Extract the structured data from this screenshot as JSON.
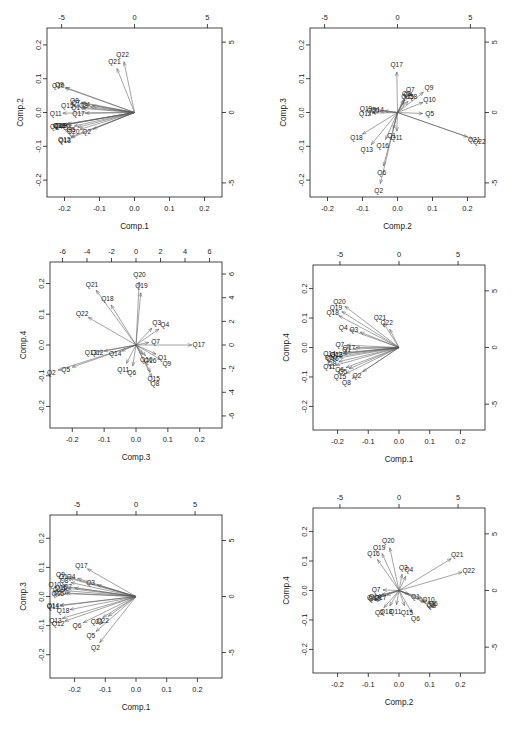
{
  "figure": {
    "type": "pca-biplot-matrix",
    "rows": 3,
    "cols": 2,
    "variables": [
      "Q1",
      "Q2",
      "Q3",
      "Q4",
      "Q5",
      "Q6",
      "Q7",
      "Q8",
      "Q9",
      "Q10",
      "Q11",
      "Q12",
      "Q13",
      "Q14",
      "Q15",
      "Q16",
      "Q17",
      "Q18",
      "Q19",
      "Q20",
      "Q21",
      "Q22"
    ]
  },
  "chart_data": [
    {
      "id": "panel-comp1-comp2",
      "type": "scatter",
      "title": "",
      "xlabel": "Comp.1",
      "ylabel": "Comp.2",
      "xlim": [
        -0.25,
        0.25
      ],
      "ylim": [
        -0.25,
        0.25
      ],
      "xticks": [
        "-0.2",
        "-0.1",
        "0.0",
        "0.1",
        "0.2"
      ],
      "xtickvals": [
        -0.2,
        -0.1,
        0.0,
        0.1,
        0.2
      ],
      "yticks": [
        "-0.2",
        "-0.1",
        "0.0",
        "0.1",
        "0.2"
      ],
      "ytickvals": [
        -0.2,
        -0.1,
        0.0,
        0.1,
        0.2
      ],
      "top_axis_ticks": [
        "-5",
        "0",
        "5"
      ],
      "top_axis_vals": [
        -5,
        0,
        5
      ],
      "right_axis_ticks": [
        "5",
        "0",
        "-5"
      ],
      "right_axis_vals": [
        5,
        0,
        -5
      ],
      "secondary_scale": 24.0,
      "grid": false,
      "legend": "none",
      "vectors": [
        {
          "label": "Q1",
          "x": -0.148,
          "y": 0.012
        },
        {
          "label": "Q2",
          "x": -0.118,
          "y": -0.049
        },
        {
          "label": "Q3",
          "x": -0.126,
          "y": 0.017
        },
        {
          "label": "Q4",
          "x": -0.12,
          "y": 0.02
        },
        {
          "label": "Q5",
          "x": -0.162,
          "y": -0.044
        },
        {
          "label": "Q6",
          "x": -0.172,
          "y": -0.04
        },
        {
          "label": "Q7",
          "x": -0.148,
          "y": 0.027
        },
        {
          "label": "Q8",
          "x": -0.152,
          "y": 0.03
        },
        {
          "label": "Q9",
          "x": -0.196,
          "y": 0.074
        },
        {
          "label": "Q10",
          "x": -0.199,
          "y": 0.073
        },
        {
          "label": "Q11",
          "x": -0.205,
          "y": -0.002
        },
        {
          "label": "Q12",
          "x": -0.182,
          "y": -0.072
        },
        {
          "label": "Q13",
          "x": -0.181,
          "y": -0.075
        },
        {
          "label": "Q14",
          "x": -0.204,
          "y": -0.037
        },
        {
          "label": "Q15",
          "x": -0.172,
          "y": 0.018
        },
        {
          "label": "Q16",
          "x": -0.194,
          "y": -0.034
        },
        {
          "label": "Q17",
          "x": -0.14,
          "y": -0.002
        },
        {
          "label": "Q18",
          "x": -0.196,
          "y": -0.036
        },
        {
          "label": "Q19",
          "x": -0.19,
          "y": -0.035
        },
        {
          "label": "Q20",
          "x": -0.156,
          "y": -0.05
        },
        {
          "label": "Q21",
          "x": -0.05,
          "y": 0.13
        },
        {
          "label": "Q22",
          "x": -0.03,
          "y": 0.15
        }
      ]
    },
    {
      "id": "panel-comp2-comp3",
      "type": "scatter",
      "title": "",
      "xlabel": "Comp.2",
      "ylabel": "Comp.3",
      "xlim": [
        -0.25,
        0.25
      ],
      "ylim": [
        -0.25,
        0.25
      ],
      "xticks": [
        "-0.2",
        "-0.1",
        "0.0",
        "0.1",
        "0.2"
      ],
      "xtickvals": [
        -0.2,
        -0.1,
        0.0,
        0.1,
        0.2
      ],
      "yticks": [
        "-0.2",
        "-0.1",
        "0.0",
        "0.1",
        "0.2"
      ],
      "ytickvals": [
        -0.2,
        -0.1,
        0.0,
        0.1,
        0.2
      ],
      "top_axis_ticks": [
        "-5",
        "0",
        "5"
      ],
      "top_axis_vals": [
        -5,
        0,
        5
      ],
      "right_axis_ticks": [
        "5",
        "0",
        "-5"
      ],
      "right_axis_vals": [
        5,
        0,
        -5
      ],
      "secondary_scale": 24.0,
      "grid": false,
      "legend": "none",
      "vectors": [
        {
          "label": "Q1",
          "x": -0.012,
          "y": -0.048
        },
        {
          "label": "Q2",
          "x": -0.049,
          "y": -0.21
        },
        {
          "label": "Q3",
          "x": 0.017,
          "y": 0.038
        },
        {
          "label": "Q4",
          "x": 0.02,
          "y": 0.036
        },
        {
          "label": "Q5",
          "x": 0.072,
          "y": -0.003
        },
        {
          "label": "Q6",
          "x": -0.04,
          "y": -0.158
        },
        {
          "label": "Q7",
          "x": 0.027,
          "y": 0.05
        },
        {
          "label": "Q8",
          "x": 0.03,
          "y": 0.033
        },
        {
          "label": "Q9",
          "x": 0.074,
          "y": 0.06
        },
        {
          "label": "Q10",
          "x": 0.073,
          "y": 0.03
        },
        {
          "label": "Q11",
          "x": -0.002,
          "y": -0.055
        },
        {
          "label": "Q12",
          "x": -0.072,
          "y": -0.002
        },
        {
          "label": "Q13",
          "x": -0.075,
          "y": -0.095
        },
        {
          "label": "Q14",
          "x": -0.037,
          "y": 0.005
        },
        {
          "label": "Q15",
          "x": 0.018,
          "y": 0.03
        },
        {
          "label": "Q16",
          "x": -0.034,
          "y": -0.08
        },
        {
          "label": "Q17",
          "x": -0.002,
          "y": 0.12
        },
        {
          "label": "Q18",
          "x": -0.1,
          "y": -0.064
        },
        {
          "label": "Q19",
          "x": -0.07,
          "y": 0.01
        },
        {
          "label": "Q20",
          "x": -0.05,
          "y": 0.003
        },
        {
          "label": "Q21",
          "x": 0.2,
          "y": -0.072
        },
        {
          "label": "Q22",
          "x": 0.215,
          "y": -0.078
        }
      ]
    },
    {
      "id": "panel-comp3-comp4",
      "type": "scatter",
      "title": "",
      "xlabel": "Comp.3",
      "ylabel": "Comp.4",
      "xlim": [
        -0.27,
        0.27
      ],
      "ylim": [
        -0.27,
        0.27
      ],
      "xticks": [
        "-0.2",
        "-0.1",
        "0.0",
        "0.1",
        "0.2"
      ],
      "xtickvals": [
        -0.2,
        -0.1,
        0.0,
        0.1,
        0.2
      ],
      "yticks": [
        "-0.2",
        "-0.1",
        "0.0",
        "0.1",
        "0.2"
      ],
      "ytickvals": [
        -0.2,
        -0.1,
        0.0,
        0.1,
        0.2
      ],
      "top_axis_ticks": [
        "-6",
        "-4",
        "-2",
        "0",
        "2",
        "4",
        "6"
      ],
      "top_axis_vals": [
        -6,
        -4,
        -2,
        0,
        2,
        4,
        6
      ],
      "right_axis_ticks": [
        "6",
        "4",
        "2",
        "0",
        "-2",
        "-4",
        "-6"
      ],
      "right_axis_vals": [
        6,
        4,
        2,
        0,
        -2,
        -4,
        -6
      ],
      "secondary_scale": 26.0,
      "grid": false,
      "legend": "none",
      "vectors": [
        {
          "label": "Q1",
          "x": 0.063,
          "y": -0.03
        },
        {
          "label": "Q2",
          "x": -0.245,
          "y": -0.082
        },
        {
          "label": "Q3",
          "x": 0.05,
          "y": 0.055
        },
        {
          "label": "Q4",
          "x": 0.072,
          "y": 0.052
        },
        {
          "label": "Q5",
          "x": -0.2,
          "y": -0.072
        },
        {
          "label": "Q6",
          "x": -0.01,
          "y": -0.068
        },
        {
          "label": "Q7",
          "x": 0.04,
          "y": 0.008
        },
        {
          "label": "Q8",
          "x": 0.05,
          "y": -0.105
        },
        {
          "label": "Q9",
          "x": 0.078,
          "y": -0.048
        },
        {
          "label": "Q10",
          "x": 0.02,
          "y": -0.03
        },
        {
          "label": "Q11",
          "x": -0.03,
          "y": -0.06
        },
        {
          "label": "Q12",
          "x": -0.1,
          "y": -0.02
        },
        {
          "label": "Q13",
          "x": -0.12,
          "y": -0.022
        },
        {
          "label": "Q14",
          "x": -0.045,
          "y": -0.02
        },
        {
          "label": "Q15",
          "x": 0.045,
          "y": -0.088
        },
        {
          "label": "Q16",
          "x": 0.03,
          "y": -0.035
        },
        {
          "label": "Q17",
          "x": 0.175,
          "y": 0.0
        },
        {
          "label": "Q18",
          "x": -0.078,
          "y": 0.13
        },
        {
          "label": "Q19",
          "x": 0.015,
          "y": 0.17
        },
        {
          "label": "Q20",
          "x": 0.01,
          "y": 0.205
        },
        {
          "label": "Q21",
          "x": -0.125,
          "y": 0.178
        },
        {
          "label": "Q22",
          "x": -0.15,
          "y": 0.09
        }
      ]
    },
    {
      "id": "panel-comp1-comp4",
      "type": "scatter",
      "title": "",
      "xlabel": "Comp.1",
      "ylabel": "Comp.4",
      "xlim": [
        -0.28,
        0.28
      ],
      "ylim": [
        -0.28,
        0.28
      ],
      "xticks": [
        "-0.2",
        "-0.1",
        "0.0",
        "0.1",
        "0.2"
      ],
      "xtickvals": [
        -0.2,
        -0.1,
        0.0,
        0.1,
        0.2
      ],
      "yticks": [
        "-0.2",
        "-0.1",
        "0.0",
        "0.1",
        "0.2"
      ],
      "ytickvals": [
        -0.2,
        -0.1,
        0.0,
        0.1,
        0.2
      ],
      "top_axis_ticks": [
        "-5",
        "0",
        "5"
      ],
      "top_axis_vals": [
        -5,
        0,
        5
      ],
      "right_axis_ticks": [
        "5",
        "0",
        "-5"
      ],
      "right_axis_vals": [
        5,
        0,
        -5
      ],
      "secondary_scale": 26.0,
      "grid": false,
      "legend": "none",
      "vectors": [
        {
          "label": "Q1",
          "x": -0.148,
          "y": -0.005
        },
        {
          "label": "Q2",
          "x": -0.118,
          "y": -0.082
        },
        {
          "label": "Q3",
          "x": -0.126,
          "y": 0.052
        },
        {
          "label": "Q4",
          "x": -0.16,
          "y": 0.06
        },
        {
          "label": "Q5",
          "x": -0.162,
          "y": -0.072
        },
        {
          "label": "Q6",
          "x": -0.172,
          "y": -0.068
        },
        {
          "label": "Q7",
          "x": -0.17,
          "y": 0.008
        },
        {
          "label": "Q8",
          "x": -0.152,
          "y": -0.105
        },
        {
          "label": "Q9",
          "x": -0.196,
          "y": -0.048
        },
        {
          "label": "Q10",
          "x": -0.199,
          "y": -0.03
        },
        {
          "label": "Q11",
          "x": -0.205,
          "y": -0.06
        },
        {
          "label": "Q12",
          "x": -0.182,
          "y": -0.02
        },
        {
          "label": "Q13",
          "x": -0.181,
          "y": -0.022
        },
        {
          "label": "Q14",
          "x": -0.204,
          "y": -0.02
        },
        {
          "label": "Q15",
          "x": -0.172,
          "y": -0.088
        },
        {
          "label": "Q16",
          "x": -0.194,
          "y": -0.035
        },
        {
          "label": "Q17",
          "x": -0.14,
          "y": 0.0
        },
        {
          "label": "Q18",
          "x": -0.196,
          "y": 0.108
        },
        {
          "label": "Q19",
          "x": -0.186,
          "y": 0.122
        },
        {
          "label": "Q20",
          "x": -0.176,
          "y": 0.14
        },
        {
          "label": "Q21",
          "x": -0.05,
          "y": 0.082
        },
        {
          "label": "Q22",
          "x": -0.03,
          "y": 0.062
        }
      ]
    },
    {
      "id": "panel-comp1-comp3",
      "type": "scatter",
      "title": "",
      "xlabel": "Comp.1",
      "ylabel": "Comp.3",
      "xlim": [
        -0.28,
        0.28
      ],
      "ylim": [
        -0.28,
        0.28
      ],
      "xticks": [
        "-0.2",
        "-0.1",
        "0.0",
        "0.1",
        "0.2"
      ],
      "xtickvals": [
        -0.2,
        -0.1,
        0.0,
        0.1,
        0.2
      ],
      "yticks": [
        "-0.2",
        "-0.1",
        "0.0",
        "0.1",
        "0.2"
      ],
      "ytickvals": [
        -0.2,
        -0.1,
        0.0,
        0.1,
        0.2
      ],
      "top_axis_ticks": [
        "-5",
        "0",
        "5"
      ],
      "top_axis_vals": [
        -5,
        0,
        5
      ],
      "right_axis_ticks": [
        "5",
        "0",
        "-5"
      ],
      "right_axis_vals": [
        5,
        0,
        -5
      ],
      "secondary_scale": 26.0,
      "grid": false,
      "legend": "none",
      "vectors": [
        {
          "label": "Q1",
          "x": -0.215,
          "y": 0.062
        },
        {
          "label": "Q2",
          "x": -0.118,
          "y": -0.158
        },
        {
          "label": "Q3",
          "x": -0.126,
          "y": 0.04
        },
        {
          "label": "Q4",
          "x": -0.19,
          "y": 0.062
        },
        {
          "label": "Q5",
          "x": -0.13,
          "y": -0.12
        },
        {
          "label": "Q6",
          "x": -0.172,
          "y": -0.09
        },
        {
          "label": "Q7",
          "x": -0.2,
          "y": 0.03
        },
        {
          "label": "Q8",
          "x": -0.212,
          "y": 0.048
        },
        {
          "label": "Q9",
          "x": -0.224,
          "y": 0.068
        },
        {
          "label": "Q10",
          "x": -0.242,
          "y": 0.036
        },
        {
          "label": "Q11",
          "x": -0.248,
          "y": -0.032
        },
        {
          "label": "Q12",
          "x": -0.232,
          "y": -0.085
        },
        {
          "label": "Q13",
          "x": -0.24,
          "y": -0.075
        },
        {
          "label": "Q14",
          "x": -0.248,
          "y": -0.03
        },
        {
          "label": "Q15",
          "x": -0.222,
          "y": 0.028
        },
        {
          "label": "Q16",
          "x": -0.232,
          "y": 0.01
        },
        {
          "label": "Q17",
          "x": -0.158,
          "y": 0.095
        },
        {
          "label": "Q18",
          "x": -0.215,
          "y": -0.045
        },
        {
          "label": "Q19",
          "x": -0.228,
          "y": 0.02
        },
        {
          "label": "Q20",
          "x": -0.226,
          "y": 0.012
        },
        {
          "label": "Q21",
          "x": -0.108,
          "y": -0.072
        },
        {
          "label": "Q22",
          "x": -0.09,
          "y": -0.068
        }
      ]
    },
    {
      "id": "panel-comp2-comp4",
      "type": "scatter",
      "title": "",
      "xlabel": "Comp.2",
      "ylabel": "Comp.4",
      "xlim": [
        -0.28,
        0.28
      ],
      "ylim": [
        -0.28,
        0.28
      ],
      "xticks": [
        "-0.2",
        "-0.1",
        "0.0",
        "0.1",
        "0.2"
      ],
      "xtickvals": [
        -0.2,
        -0.1,
        0.0,
        0.1,
        0.2
      ],
      "yticks": [
        "-0.2",
        "-0.1",
        "0.0",
        "0.1",
        "0.2"
      ],
      "ytickvals": [
        -0.2,
        -0.1,
        0.0,
        0.1,
        0.2
      ],
      "top_axis_ticks": [
        "-5",
        "0",
        "5"
      ],
      "top_axis_vals": [
        -5,
        0,
        5
      ],
      "right_axis_ticks": [
        "5",
        "0",
        "-5"
      ],
      "right_axis_vals": [
        5,
        0,
        -5
      ],
      "secondary_scale": 26.0,
      "grid": false,
      "legend": "none",
      "vectors": [
        {
          "label": "Q1",
          "x": 0.032,
          "y": -0.012
        },
        {
          "label": "Q2",
          "x": -0.049,
          "y": -0.058
        },
        {
          "label": "Q3",
          "x": 0.01,
          "y": 0.055
        },
        {
          "label": "Q4",
          "x": 0.022,
          "y": 0.048
        },
        {
          "label": "Q5",
          "x": 0.09,
          "y": -0.035
        },
        {
          "label": "Q6",
          "x": 0.042,
          "y": -0.075
        },
        {
          "label": "Q7",
          "x": -0.052,
          "y": 0.002
        },
        {
          "label": "Q8",
          "x": 0.085,
          "y": -0.042
        },
        {
          "label": "Q9",
          "x": 0.082,
          "y": -0.038
        },
        {
          "label": "Q10",
          "x": 0.074,
          "y": -0.025
        },
        {
          "label": "Q11",
          "x": -0.008,
          "y": -0.048
        },
        {
          "label": "Q12",
          "x": -0.062,
          "y": -0.018
        },
        {
          "label": "Q13",
          "x": -0.058,
          "y": -0.02
        },
        {
          "label": "Q14",
          "x": -0.056,
          "y": -0.014
        },
        {
          "label": "Q15",
          "x": 0.018,
          "y": -0.052
        },
        {
          "label": "Q16",
          "x": -0.07,
          "y": 0.105
        },
        {
          "label": "Q17",
          "x": -0.04,
          "y": -0.016
        },
        {
          "label": "Q18",
          "x": -0.03,
          "y": -0.052
        },
        {
          "label": "Q19",
          "x": -0.055,
          "y": 0.125
        },
        {
          "label": "Q20",
          "x": -0.03,
          "y": 0.145
        },
        {
          "label": "Q21",
          "x": 0.17,
          "y": 0.108
        },
        {
          "label": "Q22",
          "x": 0.205,
          "y": 0.062
        }
      ]
    }
  ]
}
